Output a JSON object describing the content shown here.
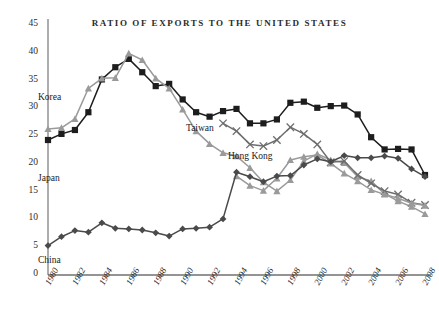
{
  "chart_data": {
    "type": "line",
    "title": "RATIO OF EXPORTS TO THE UNITED STATES",
    "xlabel": "",
    "ylabel": "",
    "xlim": [
      1980,
      2008
    ],
    "ylim": [
      0,
      45
    ],
    "ytick_step": 5,
    "xtick_step": 2,
    "grid": false,
    "legend_position": "inline-annotations",
    "x": [
      1980,
      1981,
      1982,
      1983,
      1984,
      1985,
      1986,
      1987,
      1988,
      1989,
      1990,
      1991,
      1992,
      1993,
      1994,
      1995,
      1996,
      1997,
      1998,
      1999,
      2000,
      2001,
      2002,
      2003,
      2004,
      2005,
      2006,
      2007,
      2008
    ],
    "yticks": [
      "0",
      "5",
      "10",
      "15",
      "20",
      "25",
      "30",
      "35",
      "40",
      "45"
    ],
    "xticks": [
      "1980",
      "1982",
      "1984",
      "1986",
      "1988",
      "1990",
      "1992",
      "1994",
      "1996",
      "1998",
      "2000",
      "2002",
      "2004",
      "2006",
      "2008"
    ],
    "series": [
      {
        "name": "Japan",
        "marker": "square",
        "color": "#1d1d1d",
        "label_x": 38,
        "label_y": 173,
        "values": [
          24.3,
          25.4,
          26.1,
          29.3,
          35.2,
          37.4,
          38.9,
          36.5,
          34.0,
          34.4,
          31.6,
          29.3,
          28.5,
          29.5,
          29.9,
          27.3,
          27.3,
          28.0,
          31.0,
          31.2,
          30.1,
          30.4,
          30.5,
          28.9,
          24.8,
          22.6,
          22.7,
          22.6,
          18.0
        ]
      },
      {
        "name": "Korea",
        "marker": "triangle",
        "color": "#9a9a9a",
        "label_x": 38,
        "label_y": 92,
        "values": [
          26.3,
          26.5,
          28.1,
          33.6,
          35.4,
          35.5,
          39.9,
          38.7,
          35.4,
          33.6,
          29.8,
          25.9,
          23.6,
          22.0,
          21.4,
          19.3,
          16.7,
          15.1,
          17.1,
          20.5,
          21.8,
          20.7,
          20.2,
          17.7,
          16.9,
          14.6,
          13.3,
          12.3,
          11.0
        ]
      },
      {
        "name": "Taiwan",
        "marker": "cross",
        "color": "#6e6e6e",
        "label_x": 186,
        "label_y": 123,
        "values": [
          null,
          null,
          null,
          null,
          null,
          null,
          null,
          null,
          null,
          null,
          null,
          null,
          null,
          27.3,
          25.9,
          23.5,
          23.2,
          24.3,
          26.6,
          25.4,
          23.5,
          20.3,
          20.5,
          18.0,
          16.5,
          15.1,
          14.5,
          13.0,
          12.6
        ]
      },
      {
        "name": "Hong Kong",
        "marker": "triangle",
        "color": "#9a9a9a",
        "label_x": 228,
        "label_y": 151,
        "values": [
          null,
          null,
          null,
          null,
          null,
          null,
          null,
          null,
          null,
          null,
          null,
          null,
          null,
          null,
          17.8,
          16.1,
          15.2,
          17.4,
          20.7,
          21.3,
          21.6,
          20.1,
          18.3,
          16.9,
          15.3,
          14.5,
          13.8,
          12.9,
          12.5
        ]
      },
      {
        "name": "China",
        "marker": "diamond",
        "color": "#4a4a4a",
        "label_x": 38,
        "label_y": 255,
        "values": [
          5.3,
          6.9,
          8.0,
          7.7,
          9.4,
          8.4,
          8.3,
          8.1,
          7.6,
          7.0,
          8.3,
          8.4,
          8.6,
          10.1,
          18.5,
          17.7,
          16.8,
          17.8,
          17.9,
          19.8,
          20.9,
          20.4,
          21.5,
          21.1,
          21.1,
          21.4,
          21.0,
          19.1,
          17.7
        ]
      }
    ]
  },
  "annotations": {
    "series_labels": [
      "Korea",
      "Japan",
      "Taiwan",
      "Hong Kong",
      "China"
    ]
  }
}
